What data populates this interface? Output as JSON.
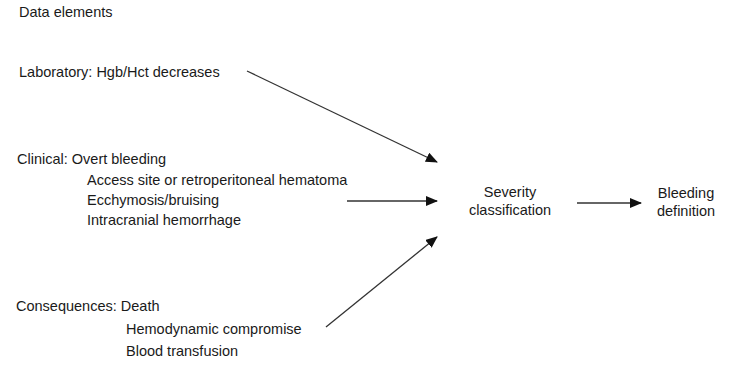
{
  "diagram": {
    "title": "Data elements",
    "groups": {
      "laboratory": {
        "label": "Laboratory: Hgb/Hct decreases"
      },
      "clinical": {
        "label": "Clinical: Overt bleeding",
        "items": [
          "Access site or retroperitoneal hematoma",
          "Ecchymosis/bruising",
          "Intracranial hemorrhage"
        ]
      },
      "consequences": {
        "label": "Consequences: Death",
        "items": [
          "Hemodynamic compromise",
          "Blood transfusion"
        ]
      }
    },
    "nodes": {
      "severity": {
        "line1": "Severity",
        "line2": "classification"
      },
      "bleeding": {
        "line1": "Bleeding",
        "line2": "definition"
      }
    },
    "edges": [
      {
        "from": "laboratory",
        "to": "severity"
      },
      {
        "from": "clinical",
        "to": "severity"
      },
      {
        "from": "consequences",
        "to": "severity"
      },
      {
        "from": "severity",
        "to": "bleeding"
      }
    ],
    "colors": {
      "text": "#1a1a1a",
      "arrow": "#222222",
      "background": "#ffffff"
    }
  }
}
